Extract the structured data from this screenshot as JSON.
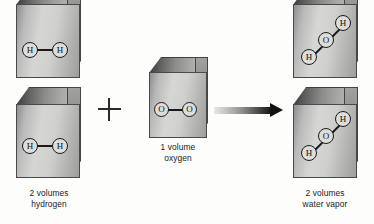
{
  "figure": {
    "background_color": "#fdfdfc"
  },
  "reactants": [
    {
      "id": "hydrogen",
      "caption": "2 volumes\nhydrogen",
      "volumes": 2,
      "substance": "hydrogen",
      "molecule": {
        "name": "H2",
        "atoms": [
          "H",
          "H"
        ],
        "geometry": "linear"
      }
    },
    {
      "id": "oxygen",
      "caption": "1 volume\noxygen",
      "volumes": 1,
      "substance": "oxygen",
      "molecule": {
        "name": "O2",
        "atoms": [
          "O",
          "O"
        ],
        "geometry": "linear"
      }
    }
  ],
  "products": [
    {
      "id": "water-vapor",
      "caption": "2 volumes\nwater vapor",
      "volumes": 2,
      "substance": "water vapor",
      "molecule": {
        "name": "H2O",
        "atoms": [
          "H",
          "O",
          "H"
        ],
        "geometry": "bent-diagonal"
      }
    }
  ],
  "operators": {
    "plus": "+",
    "arrow": "yields-arrow"
  },
  "atom_labels": {
    "hydrogen": "H",
    "oxygen": "O"
  },
  "colors": {
    "cube_front": "#d6d6d4",
    "cube_top": "#6a6a68",
    "cube_side": "#8a8a88",
    "atom_outline": "#1a1a1a",
    "atom_fill": "#dddddb",
    "text": "#1b1b1b",
    "arrow_head": "#111111"
  }
}
